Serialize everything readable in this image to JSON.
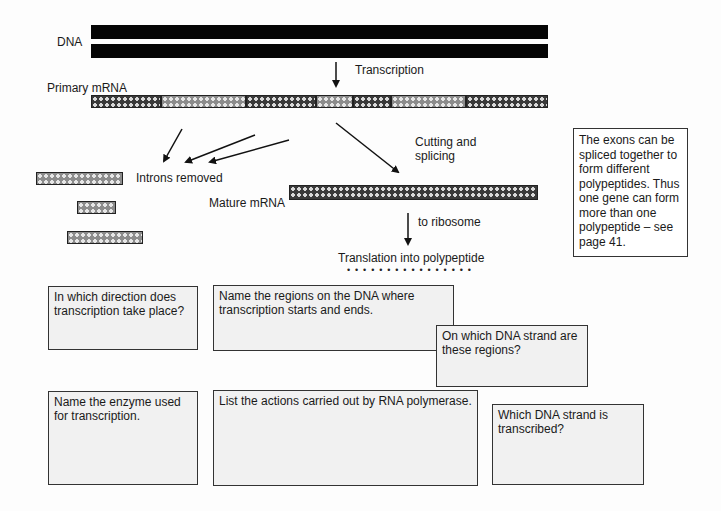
{
  "diagram": {
    "labels": {
      "dna": "DNA",
      "transcription": "Transcription",
      "primary_mrna": "Primary mRNA",
      "cutting_splicing_line1": "Cutting and",
      "cutting_splicing_line2": "splicing",
      "introns_removed": "Introns removed",
      "mature_mrna": "Mature mRNA",
      "to_ribosome": "to ribosome",
      "translation": "Translation into polypeptide",
      "polypeptide_dots": "• • • • • • • • • • • • • • • •"
    },
    "primary_mrna_segments": [
      {
        "type": "exon",
        "x": 91,
        "w": 70
      },
      {
        "type": "intron",
        "x": 161,
        "w": 85
      },
      {
        "type": "exon",
        "x": 246,
        "w": 70
      },
      {
        "type": "intron",
        "x": 316,
        "w": 37
      },
      {
        "type": "exon",
        "x": 353,
        "w": 38
      },
      {
        "type": "intron",
        "x": 391,
        "w": 75
      },
      {
        "type": "exon",
        "x": 466,
        "w": 82
      }
    ],
    "note": "The exons can be spliced together to form different polypeptides. Thus one gene can form more than one polypeptide – see page 41."
  },
  "questions": {
    "q1": "In which direction does transcription take place?",
    "q2": "Name the regions on the DNA where transcription starts and ends.",
    "q3": "On which DNA strand are these regions?",
    "q4": "Name the enzyme used for transcription.",
    "q5": "List the actions carried out by RNA polymerase.",
    "q6": "Which DNA strand is transcribed?"
  },
  "colors": {
    "dna": "#050505",
    "exon": "#3a3a3a",
    "intron": "#8c8c8c",
    "question_box_bg": "#f1f1f1"
  }
}
